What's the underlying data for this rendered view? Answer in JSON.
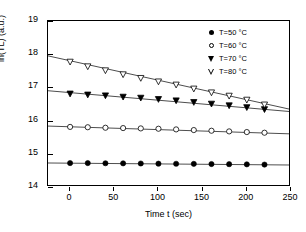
{
  "chart_data": {
    "type": "scatter",
    "title": "",
    "xlabel": "Time t  (sec)",
    "ylabel": "ln(TL)  (a.u.)",
    "xlim": [
      -25,
      250
    ],
    "ylim": [
      14,
      19
    ],
    "xticks": [
      0,
      50,
      100,
      150,
      200,
      250
    ],
    "yticks": [
      14,
      15,
      16,
      17,
      18,
      19
    ],
    "xtick_labels": [
      "0",
      "50",
      "100",
      "150",
      "200",
      "250"
    ],
    "ytick_labels": [
      "14",
      "15",
      "16",
      "17",
      "18",
      "19"
    ],
    "grid": false,
    "legend_position": "top-right",
    "x": [
      0,
      20,
      40,
      60,
      80,
      100,
      120,
      140,
      160,
      180,
      200,
      220
    ],
    "series": [
      {
        "name": "T=50 °C",
        "marker": "filled-circle",
        "color": "#000000",
        "values": [
          14.72,
          14.72,
          14.715,
          14.712,
          14.708,
          14.703,
          14.7,
          14.697,
          14.692,
          14.687,
          14.682,
          14.675
        ],
        "fit_line": {
          "x": [
            -25,
            250
          ],
          "y": [
            14.723,
            14.662
          ]
        }
      },
      {
        "name": "T=60 °C",
        "marker": "open-circle",
        "color": "#000000",
        "values": [
          15.81,
          15.8,
          15.785,
          15.775,
          15.765,
          15.755,
          15.735,
          15.715,
          15.695,
          15.675,
          15.655,
          15.635
        ],
        "fit_line": {
          "x": [
            -25,
            250
          ],
          "y": [
            15.835,
            15.6
          ]
        }
      },
      {
        "name": "T=70 °C",
        "marker": "filled-triangle-down",
        "color": "#000000",
        "values": [
          16.82,
          16.79,
          16.765,
          16.725,
          16.695,
          16.655,
          16.615,
          16.565,
          16.515,
          16.465,
          16.41,
          16.35
        ],
        "fit_line": {
          "x": [
            -25,
            250
          ],
          "y": [
            16.9,
            16.27
          ]
        }
      },
      {
        "name": "T=80 °C",
        "marker": "open-triangle-down",
        "color": "#000000",
        "values": [
          17.78,
          17.64,
          17.52,
          17.4,
          17.29,
          17.185,
          17.09,
          16.97,
          16.855,
          16.755,
          16.635,
          16.49
        ],
        "fit_line": {
          "x": [
            -25,
            250
          ],
          "y": [
            17.95,
            16.335
          ]
        }
      }
    ]
  }
}
